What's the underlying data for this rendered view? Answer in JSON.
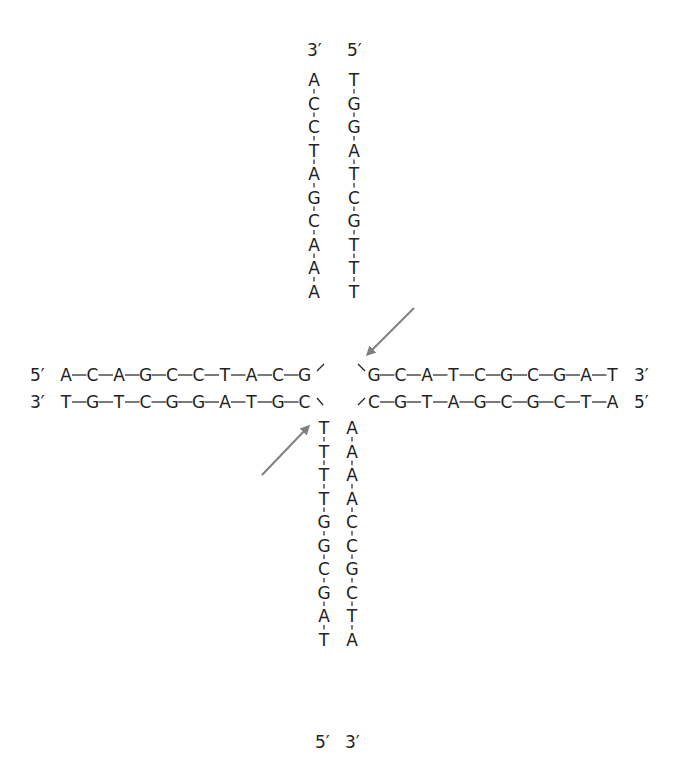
{
  "diagram": {
    "type": "Holliday junction (four-way DNA junction)",
    "colors": {
      "text": "#222222",
      "bond": "#222222",
      "arrow": "#808080",
      "background": "#ffffff"
    },
    "top_arm": {
      "left_strand": {
        "end_label": "3′",
        "bases": [
          "A",
          "C",
          "C",
          "T",
          "A",
          "G",
          "C",
          "A",
          "A",
          "A"
        ]
      },
      "right_strand": {
        "end_label": "5′",
        "bases": [
          "T",
          "G",
          "G",
          "A",
          "T",
          "C",
          "G",
          "T",
          "T",
          "T"
        ]
      }
    },
    "left_arm": {
      "top_strand": {
        "end_label": "5′",
        "bases": [
          "A",
          "C",
          "A",
          "G",
          "C",
          "C",
          "T",
          "A",
          "C",
          "G"
        ]
      },
      "bottom_strand": {
        "end_label": "3′",
        "bases": [
          "T",
          "G",
          "T",
          "C",
          "G",
          "G",
          "A",
          "T",
          "G",
          "C"
        ]
      }
    },
    "right_arm": {
      "top_strand": {
        "end_label": "3′",
        "bases": [
          "G",
          "C",
          "A",
          "T",
          "C",
          "G",
          "C",
          "G",
          "A",
          "T"
        ]
      },
      "bottom_strand": {
        "end_label": "5′",
        "bases": [
          "C",
          "G",
          "T",
          "A",
          "G",
          "C",
          "G",
          "C",
          "T",
          "A"
        ]
      }
    },
    "bottom_arm": {
      "left_strand": {
        "end_label": "5′",
        "bases": [
          "T",
          "T",
          "T",
          "T",
          "G",
          "G",
          "C",
          "G",
          "A",
          "T"
        ]
      },
      "right_strand": {
        "end_label": "3′",
        "bases": [
          "A",
          "A",
          "A",
          "A",
          "C",
          "C",
          "G",
          "C",
          "T",
          "A"
        ]
      }
    },
    "arrows": [
      {
        "name": "upper-right-cleavage-arrow",
        "points_to": "top arm right strand, last T"
      },
      {
        "name": "lower-left-cleavage-arrow",
        "points_to": "bottom arm left strand, first T"
      }
    ]
  }
}
